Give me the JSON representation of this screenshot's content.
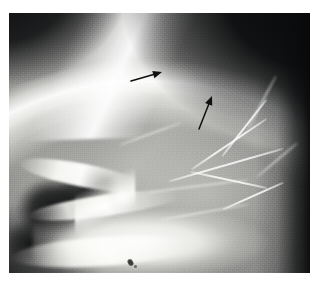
{
  "figure": {
    "kind": "radiograph",
    "modality": "plain-film-radiograph",
    "view": "lateral-skull",
    "caption": "",
    "background_color": "#ffffff",
    "plate": {
      "x": 9,
      "y": 13,
      "width": 301,
      "height": 260,
      "border_color": "#d8d8d8"
    }
  },
  "tones": {
    "film_base": "#111214",
    "air_background": "#0a0b0c",
    "vault_soft_tissue": "#9a9a98",
    "vault_light": "#bababa",
    "cortical_bone": "#ffffff",
    "sinus_air_cell": "#101112",
    "annotation_ink": "#101010"
  },
  "annotations": {
    "count": 2,
    "ink_color": "#101010",
    "arrows": [
      {
        "id": "arrow-upper",
        "label": "arrow-1",
        "direction": "right",
        "tail_x": 131,
        "tail_y": 81,
        "tip_x": 162,
        "tip_y": 72,
        "angle_deg": -16,
        "length_px": 32,
        "shaft_width_px": 1.6,
        "head_length_px": 9
      },
      {
        "id": "arrow-lower",
        "label": "arrow-2",
        "direction": "up-right",
        "tail_x": 199,
        "tail_y": 129,
        "tip_x": 212,
        "tip_y": 96,
        "angle_deg": -68,
        "length_px": 35,
        "shaft_width_px": 1.5,
        "head_length_px": 9
      }
    ]
  },
  "markers": {
    "artifact": {
      "id": "radiopaque-marker",
      "x": 128,
      "y": 259,
      "width_px": 5,
      "height_px": 7,
      "color": "#2b2c2d"
    }
  },
  "anatomy": {
    "regions": [
      {
        "name": "calvarium",
        "location": "superior-arc"
      },
      {
        "name": "cranial-vault",
        "location": "central"
      },
      {
        "name": "skull-base",
        "location": "lower-left"
      },
      {
        "name": "mastoid-air-cells",
        "location": "lower-left"
      },
      {
        "name": "vascular-groove-markings",
        "location": "right"
      },
      {
        "name": "soft-tissue-air",
        "location": "corners"
      }
    ]
  }
}
